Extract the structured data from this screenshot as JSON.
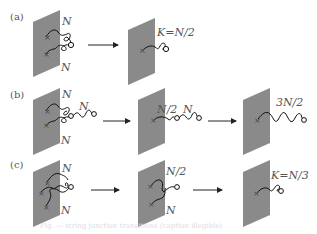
{
  "figure": {
    "plane_color": "#8a8a8a",
    "line_color": "#111111",
    "rows": [
      {
        "label": "(a)",
        "panels": [
          {
            "strings": 2,
            "labels": [
              "N",
              "N"
            ]
          },
          {
            "strings": 1,
            "labels": [
              "K=N/2"
            ]
          }
        ]
      },
      {
        "label": "(b)",
        "panels": [
          {
            "strings": 2,
            "free_string": true,
            "labels": [
              "N",
              "N",
              "N"
            ]
          },
          {
            "strings": 1,
            "free_string": true,
            "labels": [
              "N/2",
              "N"
            ]
          },
          {
            "strings": 1,
            "labels": [
              "3N/2"
            ]
          }
        ]
      },
      {
        "label": "(c)",
        "panels": [
          {
            "strings": 3,
            "labels": [
              "N",
              "N"
            ]
          },
          {
            "strings": 2,
            "labels": [
              "N/2",
              "N"
            ]
          },
          {
            "strings": 1,
            "labels": [
              "K=N/3"
            ]
          }
        ]
      }
    ],
    "caption": "Fig. — string junction transitions (caption illegible)"
  }
}
